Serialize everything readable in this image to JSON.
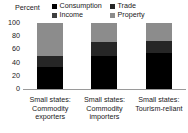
{
  "chart_data": {
    "type": "bar",
    "subtype": "stacked-bar-100",
    "title": "",
    "xlabel": "",
    "ylabel": "Percent",
    "ylim": [
      0,
      100
    ],
    "yticks": [
      0,
      20,
      40,
      60,
      80,
      100
    ],
    "ytick_labels": [
      "0",
      "20",
      "40",
      "60",
      "80",
      "100"
    ],
    "grid": false,
    "legend_position": "top",
    "categories": [
      "Small states: Commodity exporters",
      "Small states: Commodity importers",
      "Small states: Tourism-reliant"
    ],
    "category_lines": [
      [
        "Small states:",
        "Commodity",
        "exporters"
      ],
      [
        "Small states:",
        "Commodity",
        "importers"
      ],
      [
        "Small states:",
        "Tourism-reliant"
      ]
    ],
    "series": [
      {
        "name": "Consumption",
        "color": "#000000",
        "values": [
          33,
          50,
          54
        ]
      },
      {
        "name": "Income",
        "color": "#3f3f3f",
        "values": [
          0,
          0,
          0
        ]
      },
      {
        "name": "Trade",
        "color": "#262626",
        "values": [
          17,
          21,
          19
        ]
      },
      {
        "name": "Property",
        "color": "#8c8c8c",
        "values": [
          50,
          29,
          27
        ]
      }
    ],
    "legend_entries": [
      {
        "label": "Consumption",
        "color": "#000000"
      },
      {
        "label": "Income",
        "color": "#3f3f3f"
      },
      {
        "label": "Trade",
        "color": "#262626"
      },
      {
        "label": "Property",
        "color": "#8c8c8c"
      }
    ],
    "axis_color": "#9a9a9a",
    "text_color": "#1a1a1a",
    "background": "#ffffff"
  }
}
